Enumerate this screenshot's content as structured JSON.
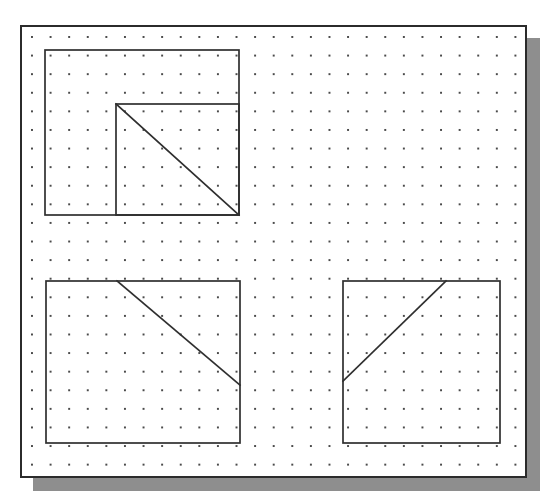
{
  "page": {
    "background_color": "#ffffff",
    "width": 559,
    "height": 503
  },
  "paper": {
    "name": "dot-grid-paper",
    "x": 20,
    "y": 25,
    "width": 507,
    "height": 453,
    "fill_color": "#ffffff",
    "border_color": "#2b2b2b",
    "border_width": 2,
    "shadow_color": "#8e8e8e",
    "shadow_offset_x": 13,
    "shadow_offset_y": 13
  },
  "grid": {
    "name": "dot-lattice",
    "dot_color": "#4a4a4a",
    "spacing_x": 18.6,
    "spacing_y": 18.6,
    "dot_radius": 1,
    "columns": 26,
    "rows": 23
  },
  "figures": [
    {
      "id": "figure-top-left",
      "label": "Large square with inner square and descending diagonal",
      "outer_square": {
        "x": 23,
        "y": 23,
        "width": 194,
        "height": 165
      },
      "inner_square": {
        "x": 94,
        "y": 77,
        "width": 123,
        "height": 111
      },
      "diagonal": {
        "x1": 94,
        "y1": 77,
        "x2": 217,
        "y2": 188
      },
      "diagonal_direction": "top-left-to-bottom-right"
    },
    {
      "id": "figure-bottom-left",
      "label": "Square with descending diagonal from top edge to right edge",
      "outer_square": {
        "x": 24,
        "y": 254,
        "width": 194,
        "height": 162
      },
      "diagonal": {
        "x1": 95,
        "y1": 254,
        "x2": 218,
        "y2": 358
      },
      "diagonal_direction": "top-left-to-bottom-right"
    },
    {
      "id": "figure-bottom-right",
      "label": "Square with ascending diagonal from left edge to top edge",
      "outer_square": {
        "x": 321,
        "y": 254,
        "width": 157,
        "height": 162
      },
      "diagonal": {
        "x1": 321,
        "y1": 354,
        "x2": 424,
        "y2": 254
      },
      "diagonal_direction": "bottom-left-to-top-right"
    }
  ],
  "style": {
    "stroke_color": "#2f2f2f",
    "stroke_width": 1.7
  }
}
